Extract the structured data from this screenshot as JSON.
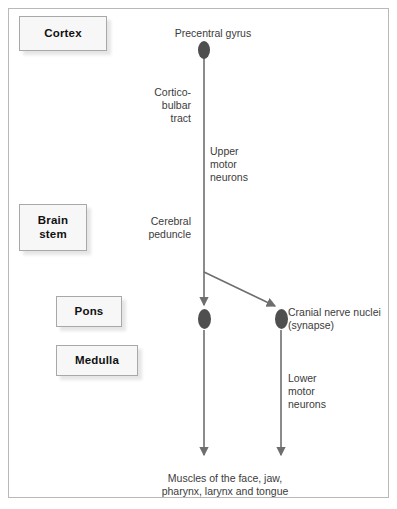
{
  "diagram": {
    "title_region_boxes": [
      {
        "id": "cortex",
        "label": "Cortex"
      },
      {
        "id": "brainstem",
        "label": "Brain\nstem"
      },
      {
        "id": "pons",
        "label": "Pons"
      },
      {
        "id": "medulla",
        "label": "Medulla"
      }
    ],
    "annotations": {
      "precentral_gyrus": "Precentral gyrus",
      "corticobulbar_tract": "Cortico-\nbulbar\ntract",
      "upper_motor_neurons": "Upper\nmotor\nneurons",
      "cerebral_peduncle": "Cerebral\npeduncle",
      "cranial_nerve_nuclei": "Cranial nerve nuclei\n(synapse)",
      "lower_motor_neurons": "Lower\nmotor\nneurons",
      "target_muscles": "Muscles of the face, jaw,\npharynx, larynx and tongue"
    },
    "nodes": [
      {
        "id": "precentral-gyrus-soma",
        "name": "neuron-cell-body"
      },
      {
        "id": "left-nucleus-soma",
        "name": "neuron-cell-body"
      },
      {
        "id": "right-nucleus-soma",
        "name": "neuron-cell-body"
      }
    ],
    "colors": {
      "node_fill": "#4f4f4f",
      "wire": "#6e6e6e",
      "frame": "#b9b9b9",
      "box_fill": "#f7f7f7",
      "box_border": "#a8a8a8",
      "text": "#3b3b3b",
      "box_text": "#111111"
    }
  }
}
